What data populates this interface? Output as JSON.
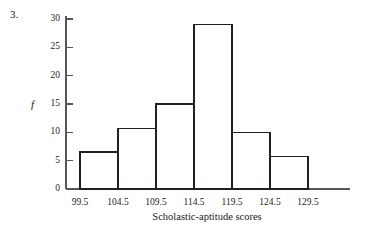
{
  "figure": {
    "problem_number": "3.",
    "y_axis_label": "f",
    "x_axis_title": "Scholastic-aptitude scores"
  },
  "chart_data": {
    "type": "bar",
    "title": "",
    "subtitle": "",
    "xlabel": "Scholastic-aptitude scores",
    "ylabel": "f",
    "bin_edges": [
      99.5,
      104.5,
      109.5,
      114.5,
      119.5,
      124.5,
      129.5
    ],
    "categories": [
      "99.5-104.5",
      "104.5-109.5",
      "109.5-114.5",
      "114.5-119.5",
      "119.5-124.5",
      "124.5-129.5"
    ],
    "values": [
      6.5,
      10.7,
      15,
      29,
      10,
      5.7
    ],
    "x_tick_labels": [
      "99.5",
      "104.5",
      "109.5",
      "114.5",
      "119.5",
      "124.5",
      "129.5"
    ],
    "y_tick_labels": [
      "0",
      "5",
      "10",
      "15",
      "20",
      "25",
      "30"
    ],
    "y_ticks": [
      0,
      5,
      10,
      15,
      20,
      25,
      30
    ],
    "ylim": [
      0,
      31
    ],
    "grid": false,
    "legend": null,
    "bar_fill": "#ffffff",
    "bar_stroke": "#231f20",
    "axis_color": "#555555",
    "background": "#ffffff"
  }
}
